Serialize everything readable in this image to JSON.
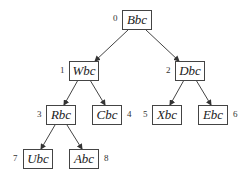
{
  "diagram": {
    "type": "binary-tree",
    "nodes": [
      {
        "index": "0",
        "label": "Bbc"
      },
      {
        "index": "1",
        "label": "Wbc"
      },
      {
        "index": "2",
        "label": "Dbc"
      },
      {
        "index": "3",
        "label": "Rbc"
      },
      {
        "index": "4",
        "label": "Cbc"
      },
      {
        "index": "5",
        "label": "Xbc"
      },
      {
        "index": "6",
        "label": "Ebc"
      },
      {
        "index": "7",
        "label": "Ubc"
      },
      {
        "index": "8",
        "label": "Abc"
      }
    ],
    "edges": [
      {
        "from": "0",
        "to": "1"
      },
      {
        "from": "0",
        "to": "2"
      },
      {
        "from": "1",
        "to": "3"
      },
      {
        "from": "1",
        "to": "4"
      },
      {
        "from": "2",
        "to": "5"
      },
      {
        "from": "2",
        "to": "6"
      },
      {
        "from": "3",
        "to": "7"
      },
      {
        "from": "3",
        "to": "8"
      }
    ]
  }
}
